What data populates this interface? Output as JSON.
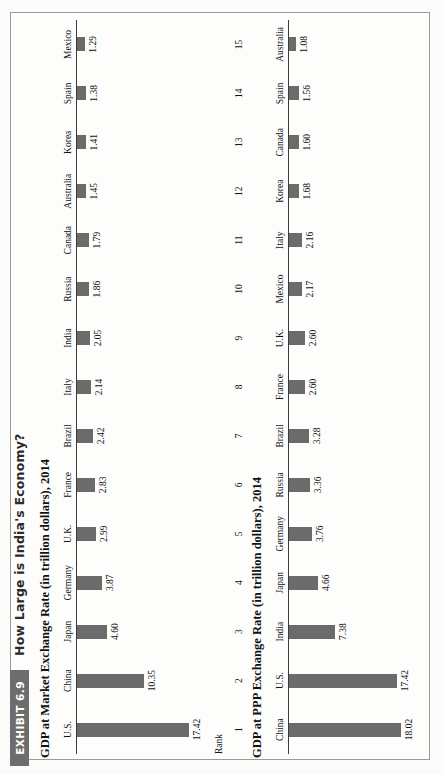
{
  "exhibit": {
    "banner_label": "EXHIBIT 6.9",
    "title": "How Large is India's Economy?"
  },
  "rank_column": {
    "header": "Rank",
    "values": [
      "1",
      "2",
      "3",
      "4",
      "5",
      "6",
      "7",
      "8",
      "9",
      "10",
      "11",
      "12",
      "13",
      "14",
      "15"
    ]
  },
  "colors": {
    "bar": "#6b6b6b",
    "banner": "#6d6d6d",
    "axis": "#3a3a3a",
    "page": "#fbfbfa",
    "text": "#121212"
  },
  "chart_data": [
    {
      "type": "bar",
      "id": "market-exchange-rate",
      "title": "GDP at Market Exchange Rate (in trillion dollars), 2014",
      "xlabel": "",
      "ylabel": "",
      "ylim": [
        0,
        18.02
      ],
      "grid": false,
      "legend": "none",
      "orientation": "vertical",
      "categories": [
        "U.S.",
        "China",
        "Japan",
        "Germany",
        "U.K.",
        "France",
        "Brazil",
        "Italy",
        "India",
        "Russia",
        "Canada",
        "Australia",
        "Korea",
        "Spain",
        "Mexico"
      ],
      "values": [
        17.42,
        10.35,
        4.6,
        3.87,
        2.99,
        2.83,
        2.42,
        2.14,
        2.05,
        1.86,
        1.79,
        1.45,
        1.41,
        1.38,
        1.29
      ],
      "value_labels": [
        "17.42",
        "10.35",
        "4.60",
        "3.87",
        "2.99",
        "2.83",
        "2.42",
        "2.14",
        "2.05",
        "1.86",
        "1.79",
        "1.45",
        "1.41",
        "1.38",
        "1.29"
      ]
    },
    {
      "type": "bar",
      "id": "ppp-exchange-rate",
      "title": "GDP at PPP Exchange Rate (in trillion dollars), 2014",
      "xlabel": "",
      "ylabel": "",
      "ylim": [
        0,
        18.02
      ],
      "grid": false,
      "legend": "none",
      "orientation": "vertical",
      "categories": [
        "China",
        "U.S.",
        "India",
        "Japan",
        "Germany",
        "Russia",
        "Brazil",
        "France",
        "U.K.",
        "Mexico",
        "Italy",
        "Korea",
        "Canada",
        "Spain",
        "Australia"
      ],
      "values": [
        18.02,
        17.42,
        7.38,
        4.66,
        3.76,
        3.36,
        3.28,
        2.6,
        2.6,
        2.17,
        2.16,
        1.68,
        1.6,
        1.56,
        1.08
      ],
      "value_labels": [
        "18.02",
        "17.42",
        "7.38",
        "4.66",
        "3.76",
        "3.36",
        "3.28",
        "2.60",
        "2.60",
        "2.17",
        "2.16",
        "1.68",
        "1.60",
        "1.56",
        "1.08"
      ]
    }
  ]
}
